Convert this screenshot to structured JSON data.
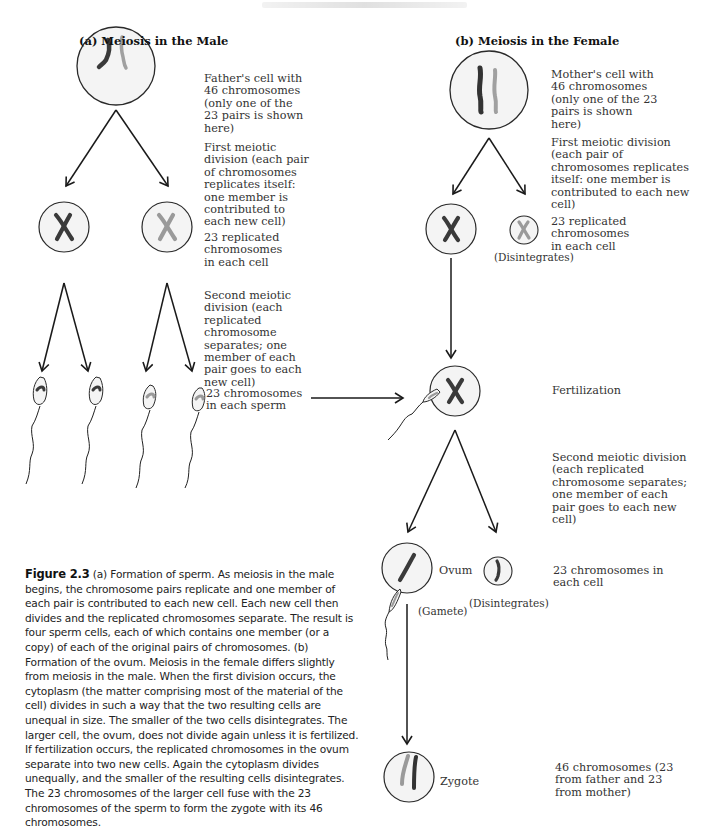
{
  "header": {
    "running_header_text": "faint, illegible running header"
  },
  "panels": {
    "male": {
      "title": "(a) Meiosis in the Male",
      "labels": {
        "father_cell": "Father's cell with 46 chromosomes (only one of the 23 pairs is shown here)",
        "first_division": "First meiotic division (each pair of chromosomes replicates itself: one member is contributed to each new cell)",
        "replicated": "23 replicated chromosomes in each cell",
        "second_division": "Second meiotic division (each replicated chromosome separates; one member of each pair goes to each new cell)",
        "sperm": "23 chromosomes in each sperm"
      }
    },
    "female": {
      "title": "(b) Meiosis in the Female",
      "labels": {
        "mother_cell": "Mother's cell with 46 chromosomes (only one of the 23 pairs is shown here)",
        "first_division": "First meiotic division (each pair of chromosomes replicates itself: one member is contributed to each new cell)",
        "replicated": "23 replicated chromosomes in each cell",
        "disintegrates_1": "(Disintegrates)",
        "fertilization": "Fertilization",
        "second_division": "Second meiotic division (each replicated chromosome separates; one member of each pair goes to each new cell)",
        "ovum": "Ovum",
        "gamete": "(Gamete)",
        "disintegrates_2": "(Disintegrates)",
        "chromosomes_each_cell": "23 chromosomes in each cell",
        "zygote": "Zygote",
        "zygote_desc": "46 chromosomes (23 from father and 23 from mother)"
      }
    }
  },
  "caption": {
    "figure_label": "Figure 2.3",
    "text": " (a) Formation of sperm. As meiosis in the male begins, the chromosome pairs replicate and one member of each pair is contributed to each new cell. Each new cell then divides and the replicated chromosomes separate. The result is four sperm cells, each of which contains one member (or a copy) of each of the original pairs of chromosomes. (b) Formation of the ovum. Meiosis in the female differs slightly from meiosis in the male. When the first division occurs, the cytoplasm (the matter comprising most of the material of the cell) divides in such a way that the two resulting cells are unequal in size. The smaller of the  two cells disintegrates. The larger cell, the ovum, does not divide again unless it is fertilized. If fertilization occurs, the replicated chromosomes in the ovum separate into two new cells. Again the cytoplasm divides unequally, and the smaller of the resulting cells disintegrates. The 23 chromosomes of the larger cell fuse with the 23 chromosomes of the sperm to form the zygote with its 46 chromosomes."
  },
  "colors": {
    "cell_fill": "#f4f4f4",
    "cell_stroke": "#2a2a2a",
    "chromosome_dark": "#3a3a3a",
    "chromosome_light": "#9a9a9a",
    "arrow": "#1a1a1a",
    "text": "#333333"
  }
}
